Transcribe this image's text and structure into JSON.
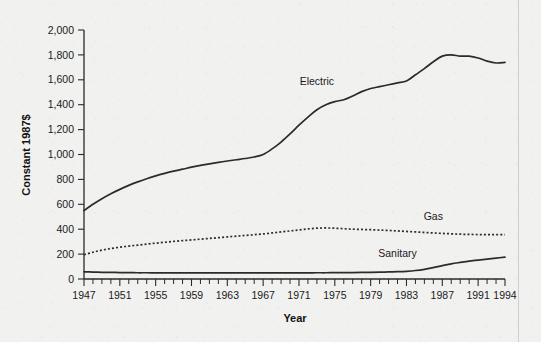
{
  "chart_data": {
    "type": "line",
    "title": "",
    "xlabel": "Year",
    "ylabel": "Constant 1987$",
    "xlim": [
      1947,
      1994
    ],
    "ylim": [
      0,
      2000
    ],
    "grid": false,
    "legend": "inline-annotations",
    "x_ticks": [
      "1947",
      "1951",
      "1955",
      "1959",
      "1963",
      "1967",
      "1971",
      "1975",
      "1979",
      "1983",
      "1987",
      "1991",
      "1994"
    ],
    "y_ticks": [
      "0",
      "200",
      "400",
      "600",
      "800",
      "1,000",
      "1,200",
      "1,400",
      "1,600",
      "1,800",
      "2,000"
    ],
    "x": [
      1947,
      1948,
      1949,
      1950,
      1951,
      1952,
      1953,
      1954,
      1955,
      1956,
      1957,
      1958,
      1959,
      1960,
      1961,
      1962,
      1963,
      1964,
      1965,
      1966,
      1967,
      1968,
      1969,
      1970,
      1971,
      1972,
      1973,
      1974,
      1975,
      1976,
      1977,
      1978,
      1979,
      1980,
      1981,
      1982,
      1983,
      1984,
      1985,
      1986,
      1987,
      1988,
      1989,
      1990,
      1991,
      1992,
      1993,
      1994
    ],
    "series": [
      {
        "name": "Electric",
        "style": "solid",
        "values": [
          550,
          600,
          645,
          685,
          720,
          752,
          780,
          805,
          828,
          848,
          866,
          882,
          898,
          912,
          925,
          937,
          948,
          958,
          968,
          980,
          1000,
          1045,
          1100,
          1165,
          1235,
          1300,
          1360,
          1400,
          1425,
          1440,
          1470,
          1505,
          1530,
          1545,
          1560,
          1575,
          1590,
          1640,
          1690,
          1745,
          1790,
          1800,
          1790,
          1790,
          1775,
          1750,
          1735,
          1740
        ]
      },
      {
        "name": "Gas",
        "style": "dotted",
        "values": [
          195,
          215,
          232,
          245,
          255,
          264,
          272,
          280,
          288,
          295,
          302,
          308,
          314,
          320,
          326,
          332,
          338,
          344,
          350,
          356,
          362,
          370,
          378,
          386,
          394,
          402,
          408,
          410,
          408,
          404,
          400,
          398,
          396,
          393,
          390,
          386,
          382,
          378,
          374,
          370,
          366,
          363,
          360,
          358,
          357,
          356,
          356,
          357
        ]
      },
      {
        "name": "Sanitary",
        "style": "solid",
        "values": [
          58,
          56,
          54,
          53,
          52,
          51,
          50,
          50,
          49,
          49,
          49,
          49,
          49,
          49,
          49,
          49,
          49,
          49,
          49,
          49,
          49,
          49,
          49,
          49,
          49,
          49,
          50,
          50,
          51,
          51,
          52,
          53,
          54,
          55,
          57,
          59,
          62,
          68,
          78,
          92,
          108,
          122,
          133,
          143,
          152,
          160,
          168,
          175
        ]
      }
    ],
    "annotations": [
      {
        "text": "Electric",
        "x": 1973,
        "y": 1560
      },
      {
        "text": "Gas",
        "x": 1986,
        "y": 470
      },
      {
        "text": "Sanitary",
        "x": 1982,
        "y": 178
      }
    ]
  },
  "colors": {
    "background": "#f1f1f0",
    "line": "#2b2b2b",
    "axis": "#2a2a2a",
    "text": "#1a1a1a"
  }
}
